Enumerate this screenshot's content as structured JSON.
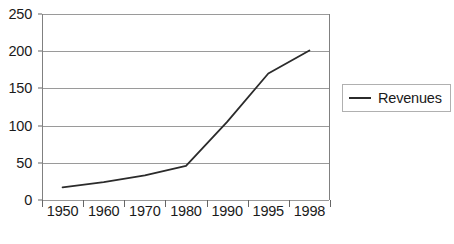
{
  "chart_data": {
    "type": "line",
    "title": "",
    "subtitle": "",
    "xlabel": "",
    "ylabel": "",
    "categories": [
      "1950",
      "1960",
      "1970",
      "1980",
      "1990",
      "1995",
      "1998"
    ],
    "series": [
      {
        "name": "Revenues",
        "color": "#2b2b2b",
        "values": [
          17,
          24,
          33,
          46,
          105,
          170,
          201
        ]
      }
    ],
    "ylim": [
      0,
      250
    ],
    "ytick_values": [
      0,
      50,
      100,
      150,
      200,
      250
    ],
    "ytick_labels": [
      "0",
      "50",
      "100",
      "150",
      "200",
      "250"
    ],
    "xtick_labels": [
      "1950",
      "1960",
      "1970",
      "1980",
      "1990",
      "1995",
      "1998"
    ],
    "grid": {
      "horizontal": true,
      "vertical": false,
      "color": "#9a9a9a"
    },
    "axis_color": "#808080",
    "plot_background": "#ffffff",
    "legend": {
      "visible": true,
      "position": "right",
      "entries": [
        {
          "label": "Revenues",
          "swatch": "line-swatch",
          "color": "#2b2b2b"
        }
      ]
    }
  }
}
